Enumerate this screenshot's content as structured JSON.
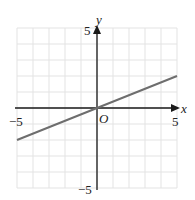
{
  "chart_data": {
    "type": "line",
    "title": "",
    "xlabel": "x",
    "ylabel": "y",
    "origin_label": "O",
    "xlim": [
      -5,
      5
    ],
    "ylim": [
      -5,
      5
    ],
    "grid": true,
    "tick_labels": {
      "x": [
        "-5",
        "5"
      ],
      "y": [
        "5",
        "-5"
      ]
    },
    "series": [
      {
        "name": "y = 0.4x",
        "x": [
          -5,
          0,
          5
        ],
        "y": [
          -2,
          0,
          2
        ],
        "color": "#6e6e6e"
      }
    ]
  },
  "labels": {
    "x_axis": "x",
    "y_axis": "y",
    "origin": "O",
    "x_min": "−5",
    "x_max": "5",
    "y_max": "5",
    "y_min": "−5"
  },
  "colors": {
    "grid": "#e3e3e3",
    "axis": "#1a1a1a",
    "line": "#6e6e6e"
  }
}
